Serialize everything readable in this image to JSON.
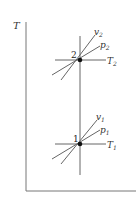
{
  "diagram": {
    "type": "T-v state diagram",
    "axis": {
      "y_label": "T",
      "x_label": ""
    },
    "states": [
      {
        "id": "2",
        "label": "2",
        "isotherm": "T",
        "isotherm_sub": "2",
        "isobar": "p",
        "isobar_sub": "2",
        "isochore": "v",
        "isochore_sub": "2"
      },
      {
        "id": "1",
        "label": "1",
        "isotherm": "T",
        "isotherm_sub": "1",
        "isobar": "p",
        "isobar_sub": "1",
        "isochore": "v",
        "isochore_sub": "1"
      }
    ],
    "colors": {
      "line": "#555555",
      "point": "#111111",
      "axis": "#666666"
    }
  }
}
